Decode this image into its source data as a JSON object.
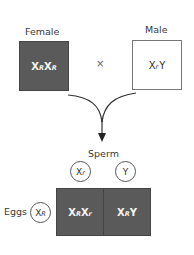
{
  "parents": {
    "female": {
      "label": "Female",
      "genotype": [
        {
          "base": "X",
          "sup": "R"
        },
        {
          "base": "X",
          "sup": "R"
        }
      ],
      "fill": "#5a5a5a"
    },
    "male": {
      "label": "Male",
      "genotype": [
        {
          "base": "X",
          "sup": "r"
        },
        {
          "base": "Y",
          "sup": ""
        }
      ],
      "fill": "#ffffff"
    },
    "cross_symbol": "×"
  },
  "punnett": {
    "sperm_label": "Sperm",
    "eggs_label": "Eggs",
    "sperm_gametes": [
      {
        "base": "X",
        "sup": "r"
      },
      {
        "base": "Y",
        "sup": ""
      }
    ],
    "egg_gametes": [
      {
        "base": "X",
        "sup": "R"
      }
    ],
    "offspring": [
      [
        {
          "base": "X",
          "sup": "R"
        },
        {
          "base": "X",
          "sup": "r"
        }
      ],
      [
        {
          "base": "X",
          "sup": "R"
        },
        {
          "base": "Y",
          "sup": ""
        }
      ]
    ],
    "offspring_fill": "#5a5a5a"
  },
  "text": {
    "female_g1_base": "X",
    "female_g1_sup": "R",
    "female_g2_base": "X",
    "female_g2_sup": "R",
    "male_g1_base": "X",
    "male_g1_sup": "r",
    "male_g2_base": "Y",
    "sperm1_base": "X",
    "sperm1_sup": "r",
    "sperm2_base": "Y",
    "egg1_base": "X",
    "egg1_sup": "R",
    "off1_a_base": "X",
    "off1_a_sup": "R",
    "off1_b_base": "X",
    "off1_b_sup": "r",
    "off2_a_base": "X",
    "off2_a_sup": "R",
    "off2_b_base": "Y"
  }
}
